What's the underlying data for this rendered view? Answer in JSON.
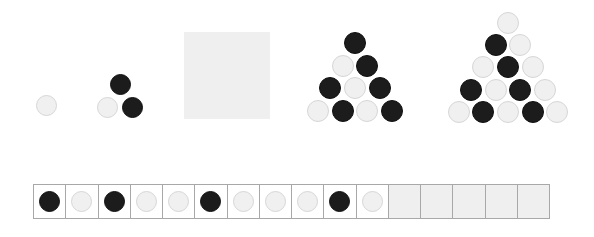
{
  "colors": {
    "black": "#1c1c1c",
    "light": "#f0f0f0",
    "missing": "#efefef"
  },
  "figures": [
    {
      "term": 1,
      "rows": [
        [
          "light"
        ]
      ]
    },
    {
      "term": 2,
      "rows": [
        [
          "black"
        ],
        [
          "light",
          "black"
        ]
      ]
    },
    {
      "term": 3,
      "missing": true
    },
    {
      "term": 4,
      "rows": [
        [
          "black"
        ],
        [
          "light",
          "black"
        ],
        [
          "black",
          "light",
          "black"
        ],
        [
          "light",
          "black",
          "light",
          "black"
        ]
      ]
    },
    {
      "term": 5,
      "rows": [
        [
          "light"
        ],
        [
          "black",
          "light"
        ],
        [
          "light",
          "black",
          "light"
        ],
        [
          "black",
          "light",
          "black",
          "light"
        ],
        [
          "light",
          "black",
          "light",
          "black",
          "light"
        ]
      ]
    }
  ],
  "strip": {
    "cells": [
      "black",
      "light",
      "black",
      "light",
      "light",
      "black",
      "light",
      "light",
      "light",
      "black",
      "light",
      "empty",
      "empty",
      "empty",
      "empty",
      "empty"
    ]
  }
}
